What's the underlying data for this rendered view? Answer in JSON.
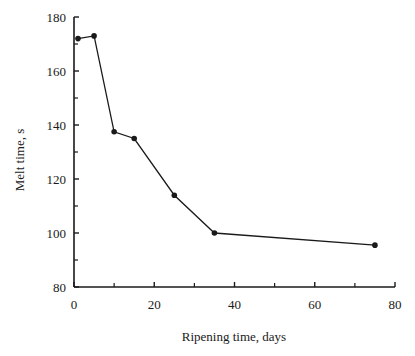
{
  "chart_data": {
    "type": "line",
    "title": "",
    "xlabel": "Ripening time, days",
    "ylabel": "Melt time, s",
    "xlim": [
      0,
      80
    ],
    "ylim": [
      80,
      180
    ],
    "x_ticks": [
      0,
      20,
      40,
      60,
      80
    ],
    "x_minor_ticks": [
      10,
      30,
      50,
      70
    ],
    "y_ticks": [
      80,
      100,
      120,
      140,
      160,
      180
    ],
    "y_minor_ticks": [
      90,
      110,
      130,
      150,
      170
    ],
    "grid": false,
    "legend": null,
    "series": [
      {
        "name": "Melt time",
        "x": [
          1,
          5,
          10,
          15,
          25,
          35,
          75
        ],
        "y": [
          172,
          173,
          137.5,
          135,
          114,
          100,
          95.5
        ],
        "marker": "circle",
        "color": "#1a1a1a"
      }
    ]
  }
}
